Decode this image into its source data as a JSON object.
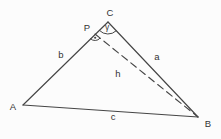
{
  "figure": {
    "background_color": "#fcfcfc",
    "stroke_color": "#454545",
    "text_color": "#333333",
    "vertices": {
      "A": {
        "x": 23,
        "y": 105,
        "label": "A",
        "label_x": 13,
        "label_y": 107
      },
      "B": {
        "x": 198,
        "y": 117,
        "label": "B",
        "label_x": 208,
        "label_y": 124
      },
      "C": {
        "x": 108,
        "y": 22,
        "label": "C",
        "label_x": 110,
        "label_y": 13
      },
      "P": {
        "x": 95,
        "y": 34,
        "label": "P",
        "label_x": 87,
        "label_y": 28
      }
    },
    "edges": [
      {
        "name": "side-b",
        "from": "A",
        "to": "C",
        "style": "solid",
        "label": "b",
        "label_x": 61,
        "label_y": 58
      },
      {
        "name": "side-a",
        "from": "C",
        "to": "B",
        "style": "solid",
        "label": "a",
        "label_x": 157,
        "label_y": 60
      },
      {
        "name": "side-c",
        "from": "A",
        "to": "B",
        "style": "solid",
        "label": "c",
        "label_x": 113,
        "label_y": 120
      },
      {
        "name": "height-h",
        "from": "P",
        "to": "B",
        "style": "dashed",
        "label": "h",
        "label_x": 118,
        "label_y": 77
      }
    ],
    "angle_marks": [
      {
        "name": "gamma-angle",
        "at": "C",
        "from": "B",
        "to": "A",
        "radius": 12,
        "label": "γ",
        "label_x": 107,
        "label_y": 30,
        "dot": false
      },
      {
        "name": "right-angle-at-P",
        "at": "P",
        "from": "B",
        "to": "A",
        "radius": 6.5,
        "label": "",
        "label_x": 0,
        "label_y": 0,
        "dot": true
      }
    ],
    "dash_pattern": "7 4.5",
    "line_width": 1.15
  }
}
